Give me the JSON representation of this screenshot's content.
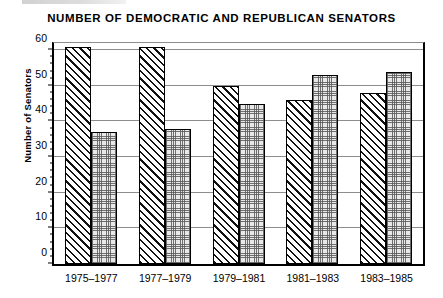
{
  "chart_data": {
    "type": "bar",
    "title": "NUMBER OF DEMOCRATIC AND REPUBLICAN SENATORS",
    "xlabel": "",
    "ylabel": "Number of Senators",
    "categories": [
      "1975–1977",
      "1977–1979",
      "1979–1981",
      "1981–1983",
      "1983–1985"
    ],
    "series": [
      {
        "name": "Democratic",
        "pattern": "diagonal-hatch",
        "values": [
          61,
          61,
          50,
          46,
          48
        ]
      },
      {
        "name": "Republican",
        "pattern": "stippled-dots",
        "values": [
          37,
          38,
          45,
          53,
          54
        ]
      }
    ],
    "ylim": [
      0,
      62
    ],
    "yticks": [
      0,
      10,
      20,
      30,
      40,
      50,
      60
    ],
    "ytick_labels": [
      "0",
      "10",
      "20",
      "30",
      "40",
      "50",
      "60"
    ],
    "yminor_interval": 2,
    "grid": "horizontal",
    "legend": "none",
    "colors": {
      "axis": "#000000",
      "gridline": "#8d8d8d",
      "democratic_fill": "#ffffff",
      "republican_fill": "#e8e8e8",
      "text": "#000000"
    }
  }
}
